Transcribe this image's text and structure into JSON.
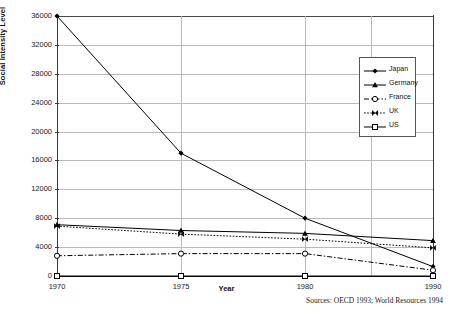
{
  "chart_data": {
    "type": "line",
    "title": "",
    "xlabel": "Year",
    "ylabel": "Social Intensity Level",
    "categories": [
      "1970",
      "1975",
      "1980",
      "1990"
    ],
    "ylim": [
      0,
      36000
    ],
    "yticks": [
      0,
      4000,
      8000,
      12000,
      16000,
      20000,
      24000,
      28000,
      32000,
      36000
    ],
    "ytick_labels": [
      "0",
      "4000",
      "8000",
      "12000",
      "16000",
      "20000",
      "24000",
      "28000",
      "32000",
      "36000"
    ],
    "grid": "horizontal-and-vertical",
    "legend_position": "top-right-inside",
    "series": [
      {
        "name": "Japan",
        "values": [
          36000,
          17000,
          8000,
          1300
        ],
        "marker": "filled-diamond",
        "line_style": "solid",
        "color": "#000000"
      },
      {
        "name": "Germany",
        "values": [
          7100,
          6300,
          5900,
          4900
        ],
        "marker": "filled-triangle",
        "line_style": "solid",
        "color": "#000000"
      },
      {
        "name": "France",
        "values": [
          2800,
          3100,
          3100,
          800
        ],
        "marker": "open-circle",
        "line_style": "dash-dot",
        "color": "#000000"
      },
      {
        "name": "UK",
        "values": [
          6900,
          5800,
          5100,
          3900
        ],
        "marker": "bowtie-x",
        "line_style": "dotted",
        "color": "#000000"
      },
      {
        "name": "US",
        "values": [
          0,
          0,
          0,
          0
        ],
        "marker": "open-square",
        "line_style": "solid",
        "color": "#000000"
      }
    ],
    "annotations": [
      "Sources: OECD 1993; World Resources 1994"
    ]
  },
  "footer": {
    "sources": "Sources: OECD 1993; World Resources 1994"
  },
  "legend": {
    "entries": [
      {
        "label": "Japan"
      },
      {
        "label": "Germany"
      },
      {
        "label": "France"
      },
      {
        "label": "UK"
      },
      {
        "label": "US"
      }
    ]
  }
}
